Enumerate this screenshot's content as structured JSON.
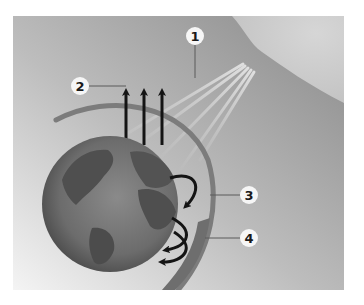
{
  "diagram": {
    "type": "greenhouse-effect",
    "background": {
      "light": "#f0f0f0",
      "dark": "#8c8c8c"
    },
    "sun": {
      "color": "#d2d2d2"
    },
    "globe": {
      "ocean": "#6e6e6e",
      "land": "#4e4e4e",
      "center": [
        110,
        204
      ],
      "radius": 68
    },
    "atmosphere_arc_color": "#7a7a7a",
    "arrow_color": "#141414",
    "ray_color": "#b5b5b5",
    "labels": [
      {
        "id": "1",
        "text": "1",
        "x": 195,
        "y": 36
      },
      {
        "id": "2",
        "text": "2",
        "x": 80,
        "y": 86
      },
      {
        "id": "3",
        "text": "3",
        "x": 249,
        "y": 195
      },
      {
        "id": "4",
        "text": "4",
        "x": 249,
        "y": 238
      }
    ]
  }
}
